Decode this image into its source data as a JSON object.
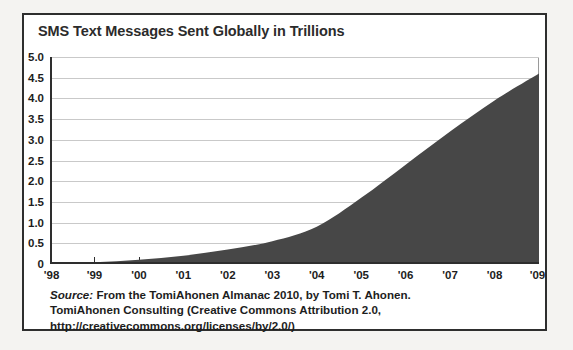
{
  "chart_data": {
    "type": "area",
    "title": "SMS Text Messages Sent Globally in Trillions",
    "xlabel": "",
    "ylabel": "",
    "categories": [
      "'98",
      "'99",
      "'00",
      "'01",
      "'02",
      "'03",
      "'04",
      "'05",
      "'06",
      "'07",
      "'08",
      "'09"
    ],
    "values": [
      0.01,
      0.04,
      0.1,
      0.2,
      0.35,
      0.55,
      0.9,
      1.6,
      2.4,
      3.2,
      3.95,
      4.6
    ],
    "ylim": [
      0,
      5.0
    ],
    "ytick_labels": [
      "5.0",
      "4.5",
      "4.0",
      "3.5",
      "3.0",
      "2.5",
      "2.0",
      "1.5",
      "1.0",
      "0.5",
      "0"
    ],
    "ytick_values": [
      5.0,
      4.5,
      4.0,
      3.5,
      3.0,
      2.5,
      2.0,
      1.5,
      1.0,
      0.5,
      0
    ],
    "grid": true,
    "legend": "none",
    "series_color": "#474747",
    "gridline_color": "#c9c9c9",
    "axis_color": "#2e2e2e"
  },
  "caption": {
    "source_word": "Source:",
    "line1_rest": " From the TomiAhonen Almanac 2010, by Tomi T. Ahonen.",
    "line2": "TomiAhonen Consulting (Creative Commons Attribution 2.0,",
    "line3": "http://creativecommons.org/licenses/by/2.0/)"
  }
}
